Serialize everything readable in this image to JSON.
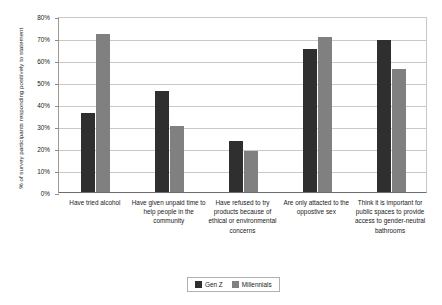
{
  "chart_data": {
    "type": "bar",
    "title": "",
    "xlabel": "",
    "ylabel": "% of survey participants responding positively to statement",
    "ylim": [
      0,
      80
    ],
    "y_tick_labels": [
      "80%",
      "70%",
      "60%",
      "50%",
      "40%",
      "30%",
      "20%",
      "10%",
      "0%"
    ],
    "y_ticks": [
      80,
      70,
      60,
      50,
      40,
      30,
      20,
      10,
      0
    ],
    "grid": true,
    "legend_position": "bottom-center",
    "categories": [
      "Have tried alcohol",
      "Have given unpaid time to help people in the community",
      "Have refused to try products because of ethical or environmental concerns",
      "Are only attacted to the oppostive sex",
      "Think it is important for public spaces to provide access to gender-neutral bathrooms"
    ],
    "series": [
      {
        "name": "Gen Z",
        "color": "#2f2f2f",
        "values": [
          36,
          46,
          23,
          65,
          69
        ]
      },
      {
        "name": "Millennials",
        "color": "#808080",
        "values": [
          72,
          30,
          18.5,
          70.5,
          56
        ]
      }
    ]
  },
  "legend": {
    "items": [
      {
        "label": "Gen Z",
        "color": "#2f2f2f"
      },
      {
        "label": "Millennials",
        "color": "#808080"
      }
    ]
  }
}
